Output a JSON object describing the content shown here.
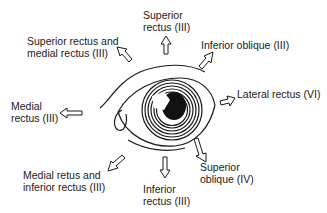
{
  "diagram": {
    "labels": {
      "superior_rectus": [
        "Superior",
        "rectus (III)"
      ],
      "superior_medial": [
        "Superior rectus and",
        "medial rectus (III)"
      ],
      "inferior_oblique": [
        "Inferior oblique (III)"
      ],
      "medial_rectus": [
        "Medial",
        "rectus (III)"
      ],
      "lateral_rectus": [
        "Lateral rectus (VI)"
      ],
      "medial_inferior": [
        "Medial retus and",
        "inferior rectus (III)"
      ],
      "inferior_rectus": [
        "Inferior",
        "rectus (III)"
      ],
      "superior_oblique": [
        "Superior",
        "oblique (IV)"
      ]
    }
  }
}
